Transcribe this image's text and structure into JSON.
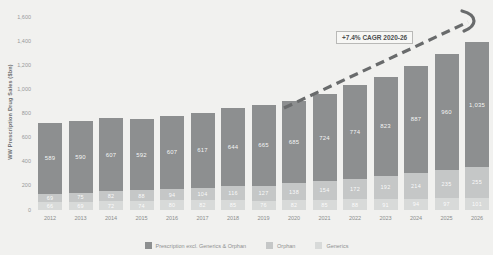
{
  "chart_data": {
    "type": "bar",
    "stacked": true,
    "ylabel": "WW Prescription Drug Sales ($bn)",
    "ylim": [
      0,
      1600
    ],
    "yticks": [
      0,
      200,
      400,
      600,
      800,
      1000,
      1200,
      1400,
      1600
    ],
    "grid": "off",
    "legend_position": "bottom",
    "categories": [
      "2012",
      "2013",
      "2014",
      "2015",
      "2016",
      "2017",
      "2018",
      "2019",
      "2020",
      "2021",
      "2022",
      "2023",
      "2024",
      "2025",
      "2026"
    ],
    "series": [
      {
        "name": "Prescription excl. Generics & Orphan",
        "color": "#8d8f90",
        "values": [
          589,
          590,
          607,
          592,
          607,
          617,
          644,
          665,
          685,
          724,
          774,
          823,
          887,
          960,
          1035
        ]
      },
      {
        "name": "Orphan",
        "color": "#c5c7c7",
        "values": [
          69,
          75,
          82,
          88,
          94,
          104,
          116,
          127,
          138,
          154,
          172,
          192,
          214,
          235,
          255
        ]
      },
      {
        "name": "Generics",
        "color": "#d8dad9",
        "values": [
          66,
          69,
          72,
          74,
          80,
          82,
          85,
          76,
          82,
          85,
          88,
          91,
          94,
          97,
          101
        ]
      }
    ],
    "annotation": {
      "label": "+7.4% CAGR 2020-26",
      "arrow_color": "#696b6c",
      "arrow_style": "dashed"
    }
  }
}
